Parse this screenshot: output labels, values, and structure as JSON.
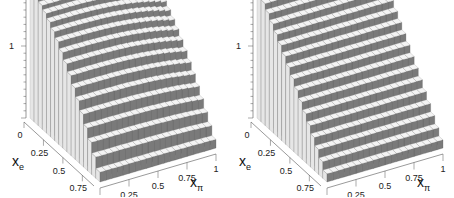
{
  "chart_data": [
    {
      "type": "lego3d",
      "panel": "left",
      "title": "",
      "xlabel": "x_π",
      "ylabel": "x_e",
      "zlabel": "",
      "xlabel_text": "x",
      "xlabel_sub": "π",
      "ylabel_text": "x",
      "ylabel_sub": "e",
      "x_ticks": [
        "0",
        "0.25",
        "0.5",
        "0.75",
        "1"
      ],
      "y_ticks": [
        "0",
        "0.25",
        "0.5",
        "0.75"
      ],
      "z_ticks": [
        "1",
        "2"
      ],
      "xlim": [
        0,
        1
      ],
      "ylim": [
        0,
        0.9
      ],
      "zlim": [
        0,
        2
      ],
      "_note": "Estimated, not read from the image: grid size and surface shape are inferred from the visual silhouette. No per-bar values are displayed in the screenshot.",
      "estimated": {
        "nx": 20,
        "ny": 17,
        "z_max": 1.8,
        "shape": "z decreases with x_e (curved, steepest at large x_e) and falls off slightly as x_pi approaches 1"
      }
    },
    {
      "type": "lego3d",
      "panel": "right",
      "title": "",
      "xlabel": "x_π",
      "ylabel": "x_e",
      "zlabel": "",
      "xlabel_text": "x",
      "xlabel_sub": "π",
      "ylabel_text": "x",
      "ylabel_sub": "e",
      "x_ticks": [
        "0",
        "0.25",
        "0.5",
        "0.75",
        "1"
      ],
      "y_ticks": [
        "0",
        "0.25",
        "0.5",
        "0.75"
      ],
      "z_ticks": [
        "1",
        "2"
      ],
      "xlim": [
        0,
        1
      ],
      "ylim": [
        0,
        0.9
      ],
      "zlim": [
        0,
        2
      ],
      "_note": "Estimated, not read from the image: grid size and surface shape are inferred from the visual silhouette. No per-bar values are displayed in the screenshot.",
      "estimated": {
        "nx": 20,
        "ny": 17,
        "z_max": 1.8,
        "shape": "z decreases roughly linearly with x_e and is independent of x_pi"
      }
    }
  ],
  "colors": {
    "bar_front": "#7a7a7a",
    "bar_top": "#f4f4f4",
    "bar_side": "#e6e6e6",
    "axis": "#555555",
    "wall_line": "#bdbdbd"
  }
}
